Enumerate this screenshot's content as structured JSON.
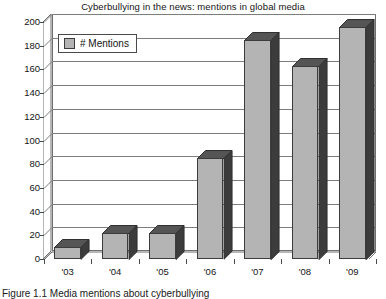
{
  "chart_data": {
    "type": "bar",
    "title": "Cyberbullying in the news:  mentions in global media",
    "xlabel": "",
    "ylabel": "",
    "categories": [
      "'03",
      "'04",
      "'05",
      "'06",
      "'07",
      "'08",
      "'09"
    ],
    "values": [
      10,
      22,
      22,
      85,
      185,
      163,
      196
    ],
    "series": [
      {
        "name": "# Mentions",
        "values": [
          10,
          22,
          22,
          85,
          185,
          163,
          196
        ]
      }
    ],
    "ylim": [
      0,
      200
    ],
    "ytick_step": 20,
    "yticks": [
      0,
      20,
      40,
      60,
      80,
      100,
      120,
      140,
      160,
      180,
      200
    ],
    "ytick_labels": [
      "0",
      "20",
      "40",
      "60",
      "80",
      "100",
      "120",
      "140",
      "160",
      "180",
      "200"
    ],
    "grid": true,
    "legend": {
      "position": "upper-left-inside",
      "entries": [
        "# Mentions"
      ]
    },
    "style": "3d-column",
    "colors": {
      "bar_front": "#b4b4b4",
      "bar_side": "#3c3c3c",
      "bar_top": "#555555",
      "bar_outline": "#3c3c3c",
      "gridline": "#7d7d7d",
      "axis": "#4a4a4a",
      "background": "#ffffff",
      "text": "#141414"
    }
  },
  "caption": {
    "text": "Figure 1.1  Media mentions about cyberbullying"
  }
}
